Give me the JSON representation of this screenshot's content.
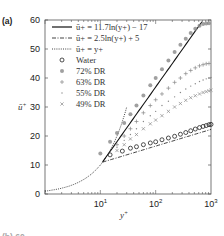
{
  "chart_data": {
    "type": "scatter",
    "panel_label": "(a)",
    "title": "",
    "xlabel": "y+",
    "ylabel": "ū+",
    "xscale": "log",
    "xlim": [
      1,
      1000
    ],
    "ylim": [
      0,
      60
    ],
    "xticks": [
      {
        "value": 10,
        "label": "10",
        "exp": "1"
      },
      {
        "value": 100,
        "label": "10",
        "exp": "2"
      },
      {
        "value": 1000,
        "label": "10",
        "exp": "3"
      }
    ],
    "yticks": [
      0,
      10,
      20,
      30,
      40,
      50,
      60
    ],
    "next_panel_label_partial": "(b) 60",
    "legend": {
      "placement": "top-left",
      "entries": [
        {
          "label": "ū+ = 11.7ln(y+) − 17",
          "style": "solid"
        },
        {
          "label": "ū+ = 2.5ln(y+) + 5",
          "style": "dashdot"
        },
        {
          "label": "ū+ = y+",
          "style": "dotted"
        },
        {
          "label": "Water",
          "marker": "circle"
        },
        {
          "label": "72% DR",
          "marker": "star"
        },
        {
          "label": "63% DR",
          "marker": "plus"
        },
        {
          "label": "55% DR",
          "marker": "dot"
        },
        {
          "label": "49% DR",
          "marker": "cross"
        }
      ]
    },
    "lines": [
      {
        "name": "ū+ = 11.7ln(y+) − 17",
        "style": "solid",
        "a": 11.7,
        "b": -17,
        "x_range": [
          11,
          1000
        ]
      },
      {
        "name": "ū+ = 2.5ln(y+) + 5",
        "style": "dashdot",
        "a": 2.5,
        "b": 5,
        "x_range": [
          11,
          1000
        ]
      },
      {
        "name": "ū+ = y+",
        "style": "dotted",
        "x_range": [
          1,
          30
        ]
      }
    ],
    "series": [
      {
        "name": "Water",
        "marker": "circle",
        "color": "#222222",
        "x": [
          15,
          25,
          35,
          45,
          60,
          80,
          100,
          130,
          170,
          220,
          280,
          350,
          430,
          520,
          620,
          720,
          820,
          920,
          1000
        ],
        "y": [
          13.5,
          14.8,
          15.8,
          16.3,
          17.0,
          17.6,
          18.0,
          18.7,
          19.3,
          19.9,
          20.6,
          21.2,
          21.8,
          22.4,
          22.9,
          23.3,
          23.6,
          23.9,
          24.0
        ]
      },
      {
        "name": "72% DR",
        "marker": "star",
        "color": "#888888",
        "x": [
          10,
          15,
          20,
          27,
          35,
          45,
          60,
          80,
          100,
          130,
          170,
          220,
          280,
          350,
          430,
          520,
          620,
          720,
          820,
          920
        ],
        "y": [
          14,
          18,
          21,
          24.5,
          27.5,
          30.5,
          34,
          37.5,
          40,
          43,
          46,
          49,
          51.5,
          53.5,
          55.5,
          57,
          58,
          58.6,
          58.8,
          58.9
        ]
      },
      {
        "name": "63% DR",
        "marker": "plus",
        "color": "#888888",
        "x": [
          20,
          27,
          35,
          45,
          60,
          80,
          100,
          130,
          170,
          220,
          280,
          350,
          430,
          520,
          620,
          720,
          820,
          920
        ],
        "y": [
          17,
          20,
          22.5,
          25,
          28,
          30.5,
          32.5,
          34.5,
          36.5,
          38.5,
          40,
          41.5,
          42.6,
          43.5,
          44.2,
          44.6,
          44.9,
          45
        ]
      },
      {
        "name": "55% DR",
        "marker": "dot",
        "color": "#888888",
        "x": [
          20,
          27,
          35,
          45,
          60,
          80,
          100,
          130,
          170,
          220,
          280,
          350,
          430,
          520,
          620,
          720,
          820,
          920,
          1000
        ],
        "y": [
          16,
          18.5,
          20.5,
          22.5,
          25,
          27,
          28.5,
          30.5,
          32,
          33.5,
          35,
          36.2,
          37.2,
          38,
          38.8,
          39.3,
          39.7,
          40,
          40.2
        ]
      },
      {
        "name": "49% DR",
        "marker": "cross",
        "color": "#888888",
        "x": [
          20,
          27,
          35,
          45,
          60,
          80,
          100,
          130,
          170,
          220,
          280,
          350,
          430,
          520,
          620,
          720,
          820,
          920,
          1000
        ],
        "y": [
          15,
          17,
          19,
          20.5,
          22.5,
          24.2,
          25.5,
          27,
          28.5,
          30,
          31.2,
          32.3,
          33.2,
          33.9,
          34.5,
          35,
          35.3,
          35.6,
          35.8
        ]
      }
    ]
  }
}
